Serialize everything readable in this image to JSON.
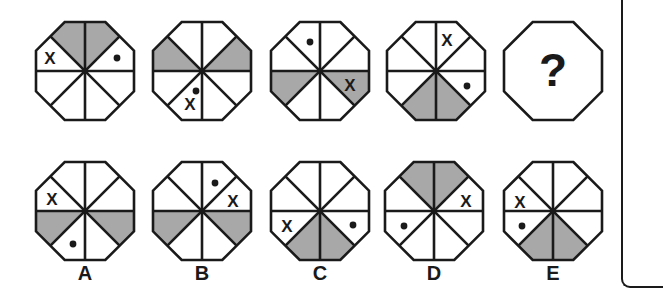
{
  "puzzle": {
    "type": "octagon-sequence",
    "colors": {
      "stroke": "#1a1a1a",
      "shade": "#a8a8a8",
      "fill": "#ffffff"
    },
    "segment_order": "s0=top-right, s1=right-upper, s2=right-lower, s3=bottom-right, s4=bottom-left, s5=left-lower, s6=left-upper, s7=top-left",
    "sequence": [
      {
        "id": "fig-1",
        "cx": 85,
        "cy": 71,
        "shaded": [
          7,
          0
        ],
        "marks": [
          {
            "type": "x",
            "text": "X",
            "segment": 6,
            "dx": -35,
            "dy": -13
          },
          {
            "type": "dot",
            "segment": 1,
            "dx": 32,
            "dy": -13
          }
        ]
      },
      {
        "id": "fig-2",
        "cx": 202,
        "cy": 71,
        "shaded": [
          6,
          1
        ],
        "marks": [
          {
            "type": "dot",
            "segment": 4,
            "dx": -6,
            "dy": 20
          },
          {
            "type": "x",
            "text": "X",
            "segment": 4,
            "dx": -12,
            "dy": 33
          }
        ]
      },
      {
        "id": "fig-3",
        "cx": 320,
        "cy": 71,
        "shaded": [
          5,
          2
        ],
        "marks": [
          {
            "type": "dot",
            "segment": 7,
            "dx": -10,
            "dy": -29
          },
          {
            "type": "x",
            "text": "X",
            "segment": 2,
            "dx": 30,
            "dy": 14
          }
        ]
      },
      {
        "id": "fig-4",
        "cx": 436,
        "cy": 71,
        "shaded": [
          4,
          3
        ],
        "marks": [
          {
            "type": "x",
            "text": "X",
            "segment": 0,
            "dx": 11,
            "dy": -31
          },
          {
            "type": "dot",
            "segment": 2,
            "dx": 31,
            "dy": 15
          }
        ]
      }
    ],
    "question": {
      "id": "fig-question",
      "cx": 553,
      "cy": 71,
      "text": "?"
    },
    "options": [
      {
        "label": "A",
        "cx": 85,
        "cy": 211,
        "shaded": [
          5,
          2
        ],
        "marks": [
          {
            "type": "x",
            "text": "X",
            "segment": 6,
            "dx": -33,
            "dy": -12
          },
          {
            "type": "dot",
            "segment": 4,
            "dx": -12,
            "dy": 33
          }
        ]
      },
      {
        "label": "B",
        "cx": 202,
        "cy": 211,
        "shaded": [
          5,
          2
        ],
        "marks": [
          {
            "type": "dot",
            "segment": 0,
            "dx": 13,
            "dy": -28
          },
          {
            "type": "x",
            "text": "X",
            "segment": 1,
            "dx": 31,
            "dy": -10
          }
        ]
      },
      {
        "label": "C",
        "cx": 320,
        "cy": 211,
        "shaded": [
          4,
          3
        ],
        "marks": [
          {
            "type": "x",
            "text": "X",
            "segment": 5,
            "dx": -33,
            "dy": 15
          },
          {
            "type": "dot",
            "segment": 2,
            "dx": 33,
            "dy": 14
          }
        ]
      },
      {
        "label": "D",
        "cx": 434,
        "cy": 211,
        "shaded": [
          7,
          0
        ],
        "marks": [
          {
            "type": "x",
            "text": "X",
            "segment": 1,
            "dx": 32,
            "dy": -10
          },
          {
            "type": "dot",
            "segment": 5,
            "dx": -30,
            "dy": 15
          }
        ]
      },
      {
        "label": "E",
        "cx": 553,
        "cy": 211,
        "shaded": [
          4,
          3
        ],
        "marks": [
          {
            "type": "x",
            "text": "X",
            "segment": 6,
            "dx": -33,
            "dy": -9
          },
          {
            "type": "dot",
            "segment": 5,
            "dx": -31,
            "dy": 15
          }
        ]
      }
    ],
    "option_label_y": 273
  }
}
